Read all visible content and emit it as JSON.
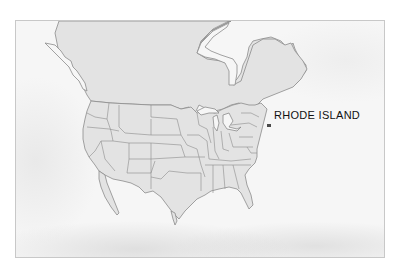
{
  "map": {
    "title": "",
    "region": "North America",
    "highlighted_state": {
      "name": "Rhode Island",
      "label": "RHODE ISLAND",
      "color": "#4a4a4a"
    },
    "colors": {
      "land": "#e3e3e3",
      "border": "#8c8c8c",
      "ocean": "#f6f6f6",
      "label_text": "#111111",
      "frame": "#c8c8c8"
    }
  }
}
